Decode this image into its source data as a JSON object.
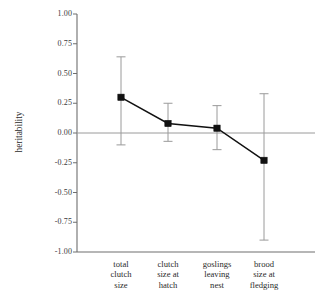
{
  "chart_data": {
    "type": "line",
    "title": "",
    "xlabel": "",
    "ylabel": "heritability",
    "ylim": [
      -1.0,
      1.0
    ],
    "grid": false,
    "legend": null,
    "zero_line": true,
    "categories": [
      "total\nclutch\nsize",
      "clutch\nsize at\nhatch",
      "goslings\nleaving\nnest",
      "brood\nsize at\nfledging"
    ],
    "ytick_labels": [
      "1.00",
      "0.75",
      "0.50",
      "0.25",
      "0.00",
      "-0.25",
      "-0.50",
      "-0.75",
      "-1.00"
    ],
    "ytick_values": [
      1.0,
      0.75,
      0.5,
      0.25,
      0.0,
      -0.25,
      -0.5,
      -0.75,
      -1.0
    ],
    "series": [
      {
        "name": "heritability",
        "values": [
          0.3,
          0.08,
          0.04,
          -0.23
        ],
        "error_low": [
          -0.1,
          -0.07,
          -0.14,
          -0.9
        ],
        "error_high": [
          0.64,
          0.25,
          0.23,
          0.33
        ]
      }
    ],
    "colors": {
      "marker": "#111111",
      "line": "#111111",
      "error_bar": "#9a9a9a",
      "axis": "#6e6e6e",
      "zero_line": "#9a9a9a",
      "background": "#ffffff"
    }
  }
}
